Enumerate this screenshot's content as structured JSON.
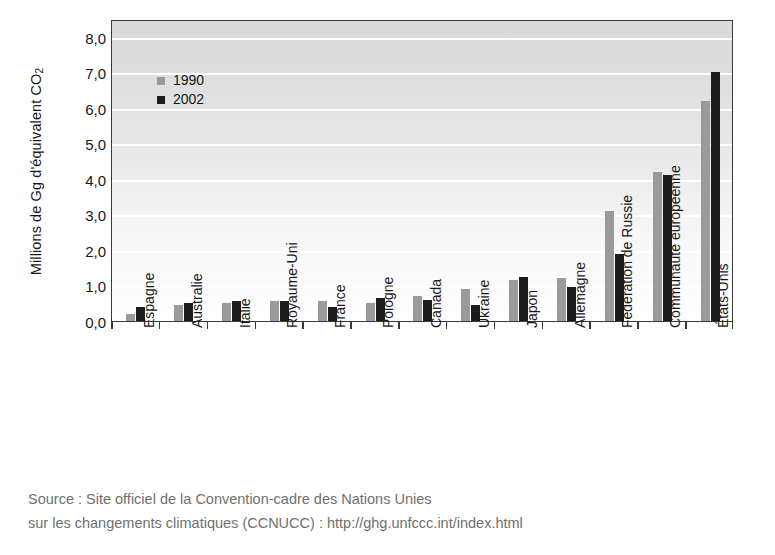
{
  "chart_data": {
    "type": "bar",
    "title": "",
    "xlabel": "",
    "ylabel": "Millions de Gg d'équivalent CO2",
    "ylabel_text": "Millions de Gg d'équivalent CO",
    "ylabel_sub": "2",
    "ylim": [
      0,
      8.5
    ],
    "yticks": [
      0.0,
      1.0,
      2.0,
      3.0,
      4.0,
      5.0,
      6.0,
      7.0,
      8.0
    ],
    "ytick_labels": [
      "0,0",
      "1,0",
      "2,0",
      "3,0",
      "4,0",
      "5,0",
      "6,0",
      "7,0",
      "8,0"
    ],
    "grid": true,
    "grid_axis": "y",
    "legend_position": "upper-left-inside",
    "categories": [
      "Espagne",
      "Australie",
      "Italie",
      "Royaume-Uni",
      "France",
      "Pologne",
      "Canada",
      "Ukraine",
      "Japon",
      "Allemagne",
      "Fédération de Russie",
      "Communauté européenne",
      "États-Unis"
    ],
    "series": [
      {
        "name": "1990",
        "color": "#9a9a9a",
        "values": [
          0.2,
          0.45,
          0.5,
          0.55,
          0.55,
          0.5,
          0.7,
          0.9,
          1.15,
          1.2,
          3.1,
          4.2,
          6.2
        ]
      },
      {
        "name": "2002",
        "color": "#1c1c1c",
        "values": [
          0.4,
          0.5,
          0.55,
          0.55,
          0.4,
          0.65,
          0.6,
          0.45,
          1.25,
          0.95,
          1.9,
          4.1,
          7.0
        ]
      }
    ]
  },
  "source": {
    "line1": "Source : Site officiel de la Convention-cadre des Nations Unies",
    "line2": "sur les changements climatiques (CCNUCC) : http://ghg.unfccc.int/index.html"
  },
  "colors": {
    "series_1990": "#9a9a9a",
    "series_2002": "#1c1c1c",
    "axis": "#3a3a3a",
    "grid": "#ffffff",
    "text": "#171717",
    "source_text": "#6f6f6f",
    "plot_bg_top": "#d9d9d9",
    "plot_bg_bottom": "#ffffff"
  }
}
